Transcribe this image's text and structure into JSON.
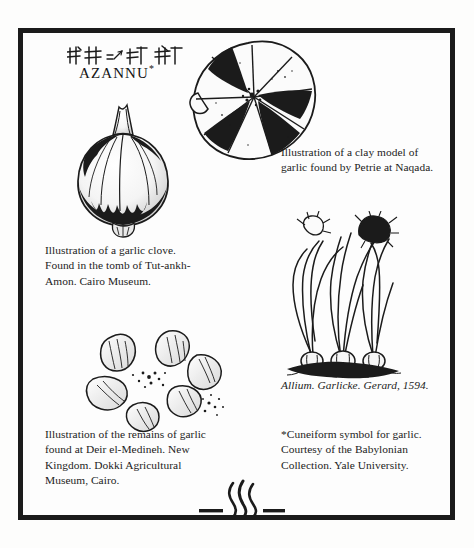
{
  "page": {
    "background_color": "#fdfdfc",
    "frame_color": "#1b1b1b"
  },
  "headword": {
    "transliteration": "AZANNU",
    "footnote_marker": "*",
    "cuneiform_name": "cuneiform-azannu-garlic"
  },
  "figures": [
    {
      "id": "garlic-clove-tutankhamon",
      "caption": "Illustration of a garlic clove. Found in the tomb of Tut-ankh-Amon. Cairo Museum."
    },
    {
      "id": "clay-model-naqada",
      "caption": "Illustration of a clay model of garlic found by Petrie at Naqada."
    },
    {
      "id": "garlic-remains-deir-el-medineh",
      "caption": "Illustration of the remains of garlic found at Deir el-Medineh. New Kingdom. Dokki Agricultural Museum, Cairo."
    },
    {
      "id": "gerard-allium-1594",
      "caption": "Allium. Garlicke. Gerard, 1594."
    }
  ],
  "footnote": {
    "text": "*Cuneiform symbol for garlic. Courtesy of the Babylonian Collection. Yale University."
  },
  "ornament": {
    "name": "flourish-three-flames"
  }
}
